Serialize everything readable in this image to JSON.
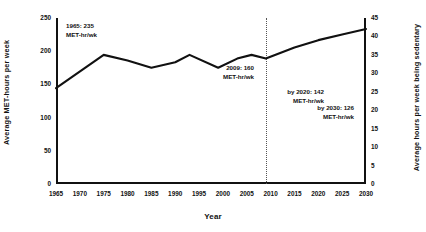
{
  "chart_data": {
    "type": "line",
    "title": "",
    "xlabel": "Year",
    "ylabel": "Average MET-hours per week",
    "ylabel_right": "Average hours per week being sedentary",
    "xlim": [
      1965,
      2030
    ],
    "ylim_left": [
      0,
      250
    ],
    "ylim_right": [
      0,
      45
    ],
    "grid": false,
    "legend": "none",
    "x_ticks": [
      "1965",
      "1970",
      "1975",
      "1980",
      "1985",
      "1990",
      "1995",
      "2000",
      "2005",
      "2010",
      "2015",
      "2020",
      "2025",
      "2030"
    ],
    "x_tick_values": [
      1965,
      1970,
      1975,
      1980,
      1985,
      1990,
      1995,
      2000,
      2005,
      2010,
      2015,
      2020,
      2025,
      2030
    ],
    "y_ticks_left": [
      "0",
      "50",
      "100",
      "150",
      "200",
      "250"
    ],
    "y_tick_values_left": [
      0,
      50,
      100,
      150,
      200,
      250
    ],
    "y_ticks_right": [
      "0",
      "5",
      "10",
      "15",
      "20",
      "25",
      "30",
      "35",
      "40",
      "45"
    ],
    "y_tick_values_right": [
      0,
      5,
      10,
      15,
      20,
      25,
      30,
      35,
      40,
      45
    ],
    "series": [
      {
        "name": "Average hours per week being sedentary",
        "axis": "right",
        "x": [
          1965,
          1975,
          1980,
          1985,
          1990,
          1993,
          1999,
          2003,
          2006,
          2009,
          2015,
          2020,
          2025,
          2030
        ],
        "values": [
          26.0,
          35.0,
          33.5,
          31.5,
          33.0,
          35.0,
          31.5,
          34.0,
          35.0,
          34.0,
          37.0,
          39.0,
          40.5,
          42.0
        ]
      }
    ],
    "annotations": [
      {
        "id": "1965",
        "line1": "1965: 235",
        "line2": "MET-hr/wk"
      },
      {
        "id": "2009",
        "line1": "2009: 160",
        "line2": "MET-hr/wk"
      },
      {
        "id": "2020",
        "line1": "by 2020: 142",
        "line2": "MET-hr/wk"
      },
      {
        "id": "2030",
        "line1": "by 2030: 126",
        "line2": "MET-hr/wk"
      }
    ],
    "marker_lines": [
      {
        "id": "marker-2009",
        "x": 2009,
        "style": "dotted"
      }
    ],
    "colors": {
      "line": "#111111",
      "axis": "#111111",
      "text": "#111111",
      "marker": "#555555",
      "background": "#ffffff"
    }
  }
}
